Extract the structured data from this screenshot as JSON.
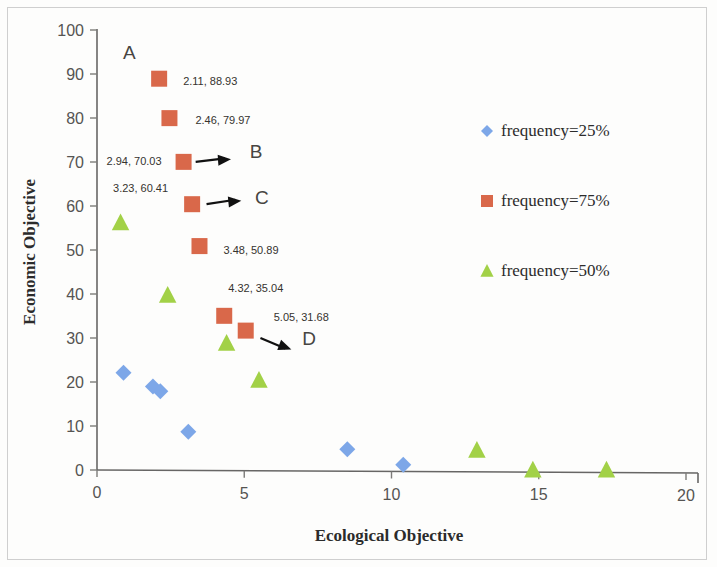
{
  "chart_data": {
    "type": "scatter",
    "title": "",
    "xlabel": "Ecological Objective",
    "ylabel": "Economic Objective",
    "xlim": [
      0,
      20
    ],
    "ylim": [
      0,
      100
    ],
    "xticks": [
      "0",
      "5",
      "10",
      "15",
      "20"
    ],
    "yticks": [
      "0",
      "10",
      "20",
      "30",
      "40",
      "50",
      "60",
      "70",
      "80",
      "90",
      "100"
    ],
    "grid": false,
    "legend_position": "right",
    "series": [
      {
        "name": "frequency=25%",
        "marker": "diamond",
        "color": "#7da7e8",
        "points": [
          {
            "x": 0.9,
            "y": 22.1
          },
          {
            "x": 1.9,
            "y": 19.0
          },
          {
            "x": 2.15,
            "y": 17.9
          },
          {
            "x": 3.1,
            "y": 8.7
          },
          {
            "x": 8.5,
            "y": 4.7
          },
          {
            "x": 10.4,
            "y": 1.2
          }
        ]
      },
      {
        "name": "frequency=75%",
        "marker": "square",
        "color": "#d9684a",
        "points": [
          {
            "x": 2.11,
            "y": 88.93,
            "label": "2.11, 88.93"
          },
          {
            "x": 2.46,
            "y": 79.97,
            "label": "2.46, 79.97"
          },
          {
            "x": 2.94,
            "y": 70.03,
            "label": "2.94, 70.03"
          },
          {
            "x": 3.23,
            "y": 60.41,
            "label": "3.23, 60.41"
          },
          {
            "x": 3.48,
            "y": 50.89,
            "label": "3.48, 50.89"
          },
          {
            "x": 4.32,
            "y": 35.04,
            "label": "4.32, 35.04"
          },
          {
            "x": 5.05,
            "y": 31.68,
            "label": "5.05, 31.68"
          }
        ]
      },
      {
        "name": "frequency=50%",
        "marker": "triangle",
        "color": "#a2d147",
        "points": [
          {
            "x": 0.8,
            "y": 56.2
          },
          {
            "x": 2.4,
            "y": 39.7
          },
          {
            "x": 4.4,
            "y": 28.8
          },
          {
            "x": 5.5,
            "y": 20.4
          },
          {
            "x": 12.9,
            "y": 4.5
          },
          {
            "x": 14.8,
            "y": 0.0
          },
          {
            "x": 17.3,
            "y": 0.0
          }
        ]
      }
    ],
    "annotations": [
      {
        "text": "A",
        "x": 1.1,
        "y": 93.5
      },
      {
        "text": "B",
        "x": 5.4,
        "y": 71.0
      },
      {
        "text": "C",
        "x": 5.6,
        "y": 60.5
      },
      {
        "text": "D",
        "x": 7.2,
        "y": 28.5
      }
    ],
    "arrows": [
      {
        "from_x": 3.35,
        "from_y": 70.03,
        "to_x": 4.55,
        "to_y": 70.6
      },
      {
        "from_x": 3.72,
        "from_y": 60.41,
        "to_x": 4.9,
        "to_y": 61.2
      },
      {
        "from_x": 5.55,
        "from_y": 30.0,
        "to_x": 6.6,
        "to_y": 27.4
      }
    ]
  },
  "axes": {
    "x_title": "Ecological Objective",
    "y_title": "Economic Objective"
  },
  "legend": {
    "items": [
      {
        "label": "frequency=25%",
        "marker": "diamond-marker",
        "color": "#7da7e8"
      },
      {
        "label": "frequency=75%",
        "marker": "square-marker",
        "color": "#d9684a"
      },
      {
        "label": "frequency=50%",
        "marker": "triangle-marker",
        "color": "#a2d147"
      }
    ]
  }
}
